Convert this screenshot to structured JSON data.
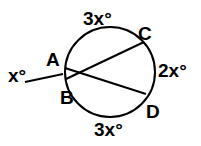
{
  "diagram": {
    "points": {
      "A": "A",
      "B": "B",
      "C": "C",
      "D": "D"
    },
    "arcs": {
      "top": "3x°",
      "right": "2x°",
      "bottom": "3x°"
    },
    "angle": "x°"
  }
}
